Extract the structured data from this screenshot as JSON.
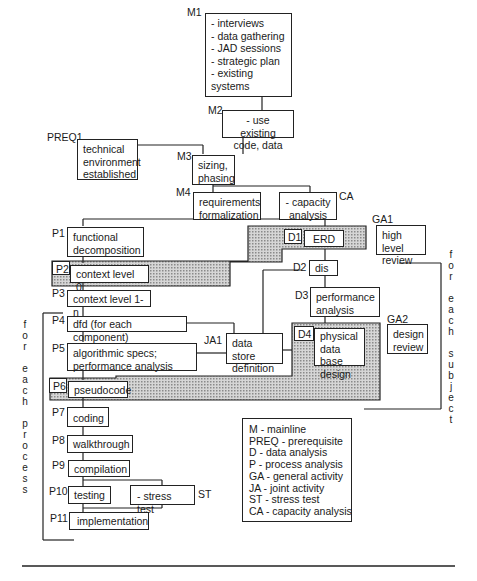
{
  "diagram": {
    "mainline": [
      {
        "id": "M1",
        "label": "M1",
        "text": "- interviews\n- data gathering\n- JAD sessions\n- strategic plan\n- existing systems"
      },
      {
        "id": "M2",
        "label": "M2",
        "text": "- use existing\ncode, data"
      },
      {
        "id": "M3",
        "label": "M3",
        "text": "sizing,\nphasing"
      },
      {
        "id": "M4",
        "label": "M4",
        "text": "requirements\nformalization"
      }
    ],
    "prereq": {
      "id": "PREQ1",
      "label": "PREQ1",
      "text": "technical\nenvironment\nestablished"
    },
    "capacity": {
      "id": "CA",
      "label": "CA",
      "text": "- capacity\nanalysis"
    },
    "process": [
      {
        "id": "P1",
        "label": "P1",
        "text": "functional\ndecomposition"
      },
      {
        "id": "P2",
        "label": "P2",
        "text": "context level 0"
      },
      {
        "id": "P3",
        "label": "P3",
        "text": "context level 1-n"
      },
      {
        "id": "P4",
        "label": "P4",
        "text": "dfd (for each component)"
      },
      {
        "id": "P5",
        "label": "P5",
        "text": "algorithmic specs;\nperformance analysis"
      },
      {
        "id": "P6",
        "label": "P6",
        "text": "pseudocode"
      },
      {
        "id": "P7",
        "label": "P7",
        "text": "coding"
      },
      {
        "id": "P8",
        "label": "P8",
        "text": "walkthrough"
      },
      {
        "id": "P9",
        "label": "P9",
        "text": "compilation"
      },
      {
        "id": "P10",
        "label": "P10",
        "text": "testing"
      },
      {
        "id": "P11",
        "label": "P11",
        "text": "implementation"
      }
    ],
    "data": [
      {
        "id": "D1",
        "label": "D1",
        "text": "ERD"
      },
      {
        "id": "D2",
        "label": "D2",
        "text": "dis"
      },
      {
        "id": "D3",
        "label": "D3",
        "text": "performance\nanalysis"
      },
      {
        "id": "D4",
        "label": "D4",
        "text": "physical\ndata base\ndesign"
      }
    ],
    "general": [
      {
        "id": "GA1",
        "label": "GA1",
        "text": "high level\nreview"
      },
      {
        "id": "GA2",
        "label": "GA2",
        "text": "design\nreview"
      }
    ],
    "joint": {
      "id": "JA1",
      "label": "JA1",
      "text": "data store\ndefinition"
    },
    "stress": {
      "id": "ST",
      "label": "ST",
      "text": "- stress test"
    },
    "bracket_process_text": "f\no\nr\n\ne\na\nc\nh\n\np\nr\no\nc\ne\ns\ns",
    "bracket_subject_text": "f\no\nr\n\ne\na\nc\nh\n\ns\nu\nb\nj\ne\nc\nt",
    "legend": [
      "M - mainline",
      "PREQ - prerequisite",
      "D - data analysis",
      "P - process analysis",
      "GA - general activity",
      "JA - joint activity",
      "ST - stress test",
      "CA - capacity analysis"
    ],
    "colors": {
      "line": "#222222",
      "shade": "#bdbdbd",
      "background": "#ffffff"
    }
  }
}
